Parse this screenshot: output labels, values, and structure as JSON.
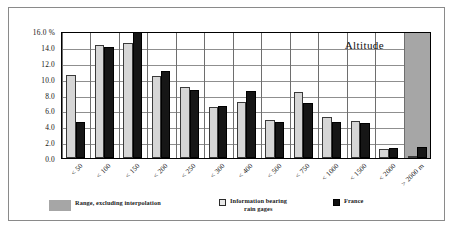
{
  "chart_data": {
    "type": "bar",
    "title": "Altitude",
    "xlabel": "",
    "ylabel": "",
    "ylim": [
      0.0,
      16.0
    ],
    "yticks": [
      "16.0 %",
      "14.0",
      "12.0",
      "10.0",
      "8.0",
      "6.0",
      "4.0",
      "2.0",
      "0.0"
    ],
    "ytick_values": [
      16.0,
      14.0,
      12.0,
      10.0,
      8.0,
      6.0,
      4.0,
      2.0,
      0.0
    ],
    "grid": true,
    "legend_position": "bottom",
    "categories": [
      "< 50",
      "< 100",
      "< 150",
      "< 200",
      "< 250",
      "< 300",
      "< 400",
      "< 500",
      "< 750",
      "< 1000",
      "< 1500",
      "< 2000",
      "> 2000 m"
    ],
    "series": [
      {
        "name": "Information bearing rain gages",
        "color": "#d6d6d6",
        "values": [
          10.4,
          14.2,
          14.5,
          10.3,
          8.9,
          6.4,
          7.1,
          4.8,
          8.3,
          5.2,
          4.7,
          1.1,
          0.1
        ]
      },
      {
        "name": "France",
        "color": "#161616",
        "values": [
          4.6,
          14.0,
          15.9,
          11.0,
          8.6,
          6.6,
          8.4,
          4.5,
          6.9,
          4.5,
          4.4,
          1.2,
          1.4
        ]
      }
    ],
    "annotations": [
      {
        "name": "range-excluding-interpolation-band",
        "label": "Range, excluding interpolation",
        "color": "#a6a6a6",
        "covers_categories": [
          "> 2000 m"
        ]
      }
    ],
    "legend": [
      {
        "label": "Range, excluding interpolation",
        "color": "#a6a6a6",
        "swatch": "range"
      },
      {
        "label_line1": "Information bearing",
        "label_line2": "rain gages",
        "color": "#e9e9e9",
        "swatch": "light"
      },
      {
        "label": "France",
        "color": "#111111",
        "swatch": "dark"
      }
    ]
  },
  "colors": {
    "frame_border": "#8a8a8a",
    "axis": "#000000",
    "gridline": "#8f8f8f",
    "background": "#ffffff"
  }
}
